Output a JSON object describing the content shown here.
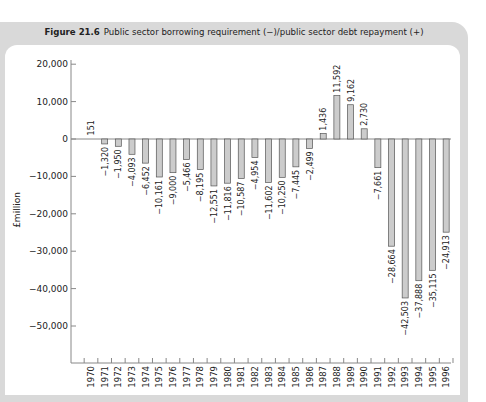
{
  "figure": {
    "number": "Figure 21.6",
    "caption": "Public sector borrowing requirement (−)/public sector debt repayment (+)"
  },
  "chart_data": {
    "type": "bar",
    "title": "Public sector borrowing requirement (−)/public sector debt repayment (+)",
    "xlabel": "",
    "ylabel": "£million",
    "ylim": [
      -60000,
      20000
    ],
    "yticks": [
      20000,
      10000,
      0,
      -10000,
      -20000,
      -30000,
      -40000,
      -50000
    ],
    "ytick_labels": [
      "20,000",
      "10,000",
      "0",
      "−10,000",
      "−20,000",
      "−30,000",
      "−40,000",
      "−50,000"
    ],
    "grid": false,
    "legend": null,
    "bar_color": "#cccccc",
    "bar_edge_color": "#555555",
    "categories": [
      "1970",
      "1971",
      "1972",
      "1973",
      "1974",
      "1975",
      "1976",
      "1977",
      "1978",
      "1979",
      "1980",
      "1981",
      "1982",
      "1983",
      "1984",
      "1985",
      "1986",
      "1987",
      "1988",
      "1989",
      "1990",
      "1991",
      "1992",
      "1993",
      "1994",
      "1995",
      "1996"
    ],
    "values": [
      151,
      -1320,
      -1950,
      -4093,
      -6452,
      -10161,
      -9000,
      -5466,
      -8195,
      -12551,
      -11816,
      -10587,
      -4954,
      -11602,
      -10250,
      -7445,
      -2499,
      1436,
      11592,
      9162,
      2730,
      -7661,
      -28664,
      -42503,
      -37888,
      -35115,
      -24913
    ],
    "value_labels": [
      "151",
      "−1,320",
      "−1,950",
      "−4,093",
      "−6,452",
      "−10,161",
      "−9,000",
      "−5,466",
      "−8,195",
      "−12,551",
      "−11,816",
      "−10,587",
      "−4,954",
      "−11,602",
      "−10,250",
      "−7,445",
      "−2,499",
      "1,436",
      "11,592",
      "9,162",
      "2,730",
      "−7,661",
      "−28,664",
      "−42,503",
      "−37,888",
      "−35,115",
      "−24,913"
    ]
  }
}
